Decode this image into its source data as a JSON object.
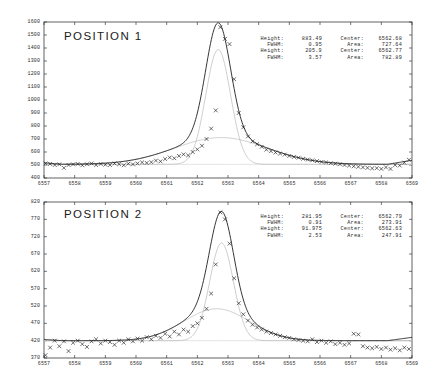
{
  "figure": {
    "background": "#ffffff",
    "ink": "#1f1f1f",
    "fit_color": "#1a1a1a",
    "component_color": "#b9b9b9",
    "baseline_color": "#cfcfcf",
    "marker_symbol": "x"
  },
  "panels": [
    {
      "id": "position-1",
      "title": "POSITION 1",
      "stats_left": [
        {
          "key": "Height:",
          "value": "883.49"
        },
        {
          "key": "FWHM:",
          "value": "0.95"
        },
        {
          "key": "Height:",
          "value": "205.9"
        },
        {
          "key": "FWHM:",
          "value": "3.57"
        }
      ],
      "stats_right": [
        {
          "key": "Center:",
          "value": "6562.68"
        },
        {
          "key": "Area:",
          "value": "727.64"
        },
        {
          "key": "Center:",
          "value": "6562.77"
        },
        {
          "key": "Area:",
          "value": "782.89"
        }
      ],
      "y_ticks": [
        1600,
        1500,
        1400,
        1300,
        1200,
        1100,
        1000,
        900,
        800,
        700,
        600,
        500,
        400
      ],
      "x_ticks": [
        6557,
        6558,
        6559,
        6560,
        6561,
        6562,
        6563,
        6564,
        6565,
        6566,
        6567,
        6568,
        6569
      ]
    },
    {
      "id": "position-2",
      "title": "POSITION 2",
      "stats_left": [
        {
          "key": "Height:",
          "value": "281.95"
        },
        {
          "key": "FWHM:",
          "value": "0.91"
        },
        {
          "key": "Height:",
          "value": "91.975"
        },
        {
          "key": "FWHM:",
          "value": "2.53"
        }
      ],
      "stats_right": [
        {
          "key": "Center:",
          "value": "6562.79"
        },
        {
          "key": "Area:",
          "value": "273.91"
        },
        {
          "key": "Center:",
          "value": "6562.63"
        },
        {
          "key": "Area:",
          "value": "247.91"
        }
      ],
      "y_ticks": [
        820,
        770,
        720,
        670,
        620,
        570,
        520,
        470,
        420,
        370
      ],
      "x_ticks": [
        6557,
        6558,
        6559,
        6560,
        6561,
        6562,
        6563,
        6564,
        6565,
        6566,
        6567,
        6568,
        6569
      ]
    }
  ],
  "chart_data": [
    {
      "type": "scatter",
      "title": "POSITION 1",
      "xlabel": "",
      "ylabel": "",
      "xlim": [
        6557,
        6569
      ],
      "ylim": [
        400,
        1600
      ],
      "grid": false,
      "legend_position": "none",
      "annotations": [
        "Height: 883.49",
        "FWHM: 0.95",
        "Height: 205.9",
        "FWHM: 3.57",
        "Center: 6562.68",
        "Area: 727.64",
        "Center: 6562.77",
        "Area: 782.89"
      ],
      "model": {
        "baseline": 505,
        "narrow": {
          "height": 883.49,
          "center": 6562.68,
          "fwhm": 0.95,
          "area": 727.64
        },
        "broad": {
          "height": 205.9,
          "center": 6562.77,
          "fwhm": 3.57,
          "area": 782.89
        },
        "continuum_slope": 6.5
      },
      "series": [
        {
          "name": "observed",
          "x": [
            6557.05,
            6557.2,
            6557.35,
            6557.5,
            6557.65,
            6557.8,
            6557.95,
            6558.1,
            6558.25,
            6558.4,
            6558.55,
            6558.7,
            6558.85,
            6559.0,
            6559.15,
            6559.3,
            6559.45,
            6559.6,
            6559.75,
            6559.9,
            6560.05,
            6560.2,
            6560.35,
            6560.5,
            6560.65,
            6560.8,
            6560.95,
            6561.1,
            6561.25,
            6561.4,
            6561.55,
            6561.7,
            6561.85,
            6562.0,
            6562.15,
            6562.3,
            6562.45,
            6562.6,
            6562.75,
            6562.9,
            6563.05,
            6563.2,
            6563.35,
            6563.5,
            6563.65,
            6563.8,
            6563.95,
            6564.1,
            6564.25,
            6564.4,
            6564.55,
            6564.7,
            6564.85,
            6565.0,
            6565.15,
            6565.3,
            6565.45,
            6565.6,
            6565.75,
            6565.9,
            6566.05,
            6566.2,
            6566.35,
            6566.5,
            6566.65,
            6566.8,
            6566.95,
            6567.1,
            6567.25,
            6567.4,
            6567.55,
            6567.7,
            6567.85,
            6568.0,
            6568.15,
            6568.3,
            6568.45,
            6568.6,
            6568.75,
            6568.9
          ],
          "y": [
            512,
            508,
            500,
            505,
            478,
            500,
            505,
            508,
            498,
            506,
            512,
            500,
            508,
            502,
            500,
            512,
            506,
            498,
            510,
            505,
            512,
            520,
            516,
            522,
            534,
            528,
            546,
            558,
            552,
            570,
            582,
            574,
            600,
            620,
            648,
            700,
            780,
            920,
            1560,
            1470,
            1430,
            1160,
            900,
            790,
            720,
            682,
            660,
            640,
            618,
            606,
            596,
            588,
            580,
            570,
            562,
            556,
            548,
            542,
            536,
            530,
            524,
            520,
            514,
            510,
            506,
            500,
            496,
            490,
            486,
            482,
            478,
            474,
            476,
            470,
            482,
            470,
            500,
            496,
            518,
            540
          ]
        }
      ]
    },
    {
      "type": "scatter",
      "title": "POSITION 2",
      "xlabel": "",
      "ylabel": "",
      "xlim": [
        6557,
        6569
      ],
      "ylim": [
        370,
        820
      ],
      "grid": false,
      "legend_position": "none",
      "annotations": [
        "Height: 281.95",
        "FWHM: 0.91",
        "Height: 91.975",
        "FWHM: 2.53",
        "Center: 6562.79",
        "Area: 273.91",
        "Center: 6562.63",
        "Area: 247.91"
      ],
      "model": {
        "baseline": 420,
        "narrow": {
          "height": 281.95,
          "center": 6562.79,
          "fwhm": 0.91,
          "area": 273.91
        },
        "broad": {
          "height": 91.975,
          "center": 6562.63,
          "fwhm": 2.53,
          "area": 247.91
        },
        "continuum_slope": 2.0
      },
      "series": [
        {
          "name": "observed",
          "x": [
            6557.05,
            6557.2,
            6557.35,
            6557.5,
            6557.65,
            6557.8,
            6557.95,
            6558.1,
            6558.25,
            6558.4,
            6558.55,
            6558.7,
            6558.85,
            6559.0,
            6559.15,
            6559.3,
            6559.45,
            6559.6,
            6559.75,
            6559.9,
            6560.05,
            6560.2,
            6560.35,
            6560.5,
            6560.65,
            6560.8,
            6560.95,
            6561.1,
            6561.25,
            6561.4,
            6561.55,
            6561.7,
            6561.85,
            6562.0,
            6562.15,
            6562.3,
            6562.45,
            6562.6,
            6562.75,
            6562.9,
            6563.05,
            6563.2,
            6563.35,
            6563.5,
            6563.65,
            6563.8,
            6563.95,
            6564.1,
            6564.25,
            6564.4,
            6564.55,
            6564.7,
            6564.85,
            6565.0,
            6565.15,
            6565.3,
            6565.45,
            6565.6,
            6565.75,
            6565.9,
            6566.05,
            6566.2,
            6566.35,
            6566.5,
            6566.65,
            6566.8,
            6566.95,
            6567.1,
            6567.25,
            6567.4,
            6567.55,
            6567.7,
            6567.85,
            6568.0,
            6568.15,
            6568.3,
            6568.45,
            6568.6,
            6568.75,
            6568.9
          ],
          "y": [
            378,
            400,
            420,
            404,
            418,
            390,
            414,
            420,
            410,
            402,
            418,
            424,
            412,
            420,
            416,
            408,
            420,
            414,
            424,
            418,
            426,
            420,
            430,
            424,
            434,
            428,
            440,
            432,
            446,
            438,
            452,
            446,
            462,
            470,
            486,
            512,
            556,
            640,
            790,
            770,
            700,
            600,
            528,
            496,
            478,
            466,
            458,
            452,
            446,
            442,
            438,
            434,
            430,
            428,
            424,
            422,
            420,
            418,
            424,
            416,
            420,
            414,
            418,
            410,
            414,
            408,
            412,
            440,
            438,
            404,
            400,
            398,
            402,
            396,
            400,
            394,
            398,
            392,
            400,
            396
          ]
        }
      ]
    }
  ]
}
